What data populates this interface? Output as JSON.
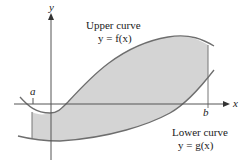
{
  "diagram": {
    "type": "area-between-curves",
    "axes": {
      "x_label": "x",
      "y_label": "y"
    },
    "bounds": {
      "left_label": "a",
      "right_label": "b"
    },
    "upper_curve": {
      "title": "Upper curve",
      "equation": "y = f(x)"
    },
    "lower_curve": {
      "title": "Lower curve",
      "equation": "y = g(x)"
    },
    "colors": {
      "shade": "#d4d4d4",
      "curve": "#6e6e6e",
      "axis": "#555555",
      "text": "#222222"
    }
  }
}
